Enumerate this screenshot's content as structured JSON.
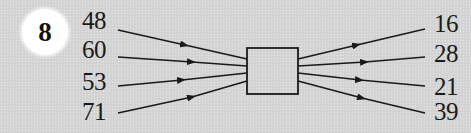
{
  "problem": {
    "number": "8"
  },
  "inputs": [
    {
      "value": "48"
    },
    {
      "value": "60"
    },
    {
      "value": "53"
    },
    {
      "value": "71"
    }
  ],
  "outputs": [
    {
      "value": "16"
    },
    {
      "value": "28"
    },
    {
      "value": "21"
    },
    {
      "value": "39"
    }
  ],
  "function_box": {
    "label": ""
  },
  "colors": {
    "background": "#d5d5d5",
    "badge": "#ffffff",
    "line": "#1a1a1a",
    "text": "#1a1a1a"
  }
}
